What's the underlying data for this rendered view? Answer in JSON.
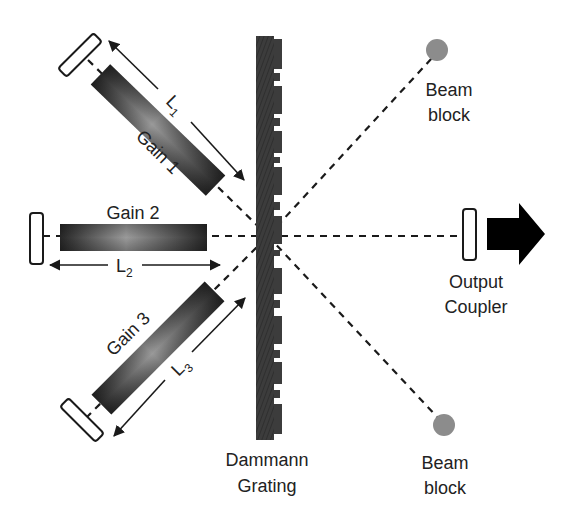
{
  "diagram": {
    "colors": {
      "background": "#ffffff",
      "ink": "#1a1a1a",
      "grating": "#3a3a3a",
      "beam_block": "#8c8c8c",
      "gain_dark": "#2b2b2b",
      "gain_light": "#9a9a9a",
      "mirror_fill": "#ffffff"
    },
    "gain_media": [
      {
        "id": "gain1",
        "label": "Gain 1"
      },
      {
        "id": "gain2",
        "label": "Gain 2"
      },
      {
        "id": "gain3",
        "label": "Gain 3"
      }
    ],
    "lengths": [
      {
        "id": "L1",
        "symbol": "L",
        "subscript": "1"
      },
      {
        "id": "L2",
        "symbol": "L",
        "subscript": "2"
      },
      {
        "id": "L3",
        "symbol": "L",
        "subscript": "3"
      }
    ],
    "grating": {
      "label_line1": "Dammann",
      "label_line2": "Grating"
    },
    "output_coupler": {
      "label_line1": "Output",
      "label_line2": "Coupler"
    },
    "beam_blocks": [
      {
        "id": "top",
        "label_line1": "Beam",
        "label_line2": "block"
      },
      {
        "id": "bottom",
        "label_line1": "Beam",
        "label_line2": "block"
      }
    ],
    "output_arrow": "output-beam-arrow"
  }
}
